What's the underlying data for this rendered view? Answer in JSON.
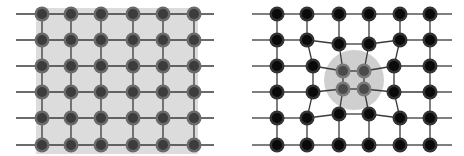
{
  "colors": {
    "background": "#ffffff",
    "left_region_fill": "#dcdcdc",
    "right_region_fill": "#cfcfcf",
    "line": "#3a3a3a",
    "node_left_outer": "#6a6a6a",
    "node_left_inner": "#3c3c3c",
    "node_right_outer": "#333333",
    "node_right_inner": "#0a0a0a",
    "node_focus_outer": "#7a7a7a",
    "node_focus_inner": "#4a4a4a"
  },
  "left_panel": {
    "label": "regular-grid",
    "region": {
      "x": 36,
      "y": 8,
      "w": 162,
      "h": 146
    },
    "line_extent": {
      "x1": 16,
      "x2": 214
    },
    "columns": [
      42,
      71,
      101,
      133,
      163,
      194
    ],
    "rows": [
      14,
      40,
      66,
      92,
      118,
      145
    ]
  },
  "right_panel": {
    "label": "warped-grid",
    "focus_circle": {
      "cx": 354,
      "cy": 80,
      "r": 30
    },
    "line_extent": {
      "x1": 252,
      "x2": 452
    },
    "nodes": [
      [
        [
          277,
          14
        ],
        [
          307,
          14
        ],
        [
          339,
          14
        ],
        [
          369,
          14
        ],
        [
          400,
          14
        ],
        [
          430,
          14
        ]
      ],
      [
        [
          277,
          40
        ],
        [
          307,
          40
        ],
        [
          339,
          44
        ],
        [
          369,
          44
        ],
        [
          400,
          40
        ],
        [
          430,
          40
        ]
      ],
      [
        [
          277,
          66
        ],
        [
          313,
          66
        ],
        [
          343,
          71
        ],
        [
          364,
          71
        ],
        [
          394,
          66
        ],
        [
          430,
          66
        ]
      ],
      [
        [
          277,
          92
        ],
        [
          313,
          92
        ],
        [
          343,
          89
        ],
        [
          364,
          89
        ],
        [
          394,
          92
        ],
        [
          430,
          92
        ]
      ],
      [
        [
          277,
          118
        ],
        [
          307,
          118
        ],
        [
          339,
          114
        ],
        [
          369,
          114
        ],
        [
          400,
          118
        ],
        [
          430,
          118
        ]
      ],
      [
        [
          277,
          145
        ],
        [
          307,
          145
        ],
        [
          339,
          145
        ],
        [
          369,
          145
        ],
        [
          400,
          145
        ],
        [
          430,
          145
        ]
      ]
    ],
    "focus_nodes": [
      [
        2,
        2
      ],
      [
        2,
        3
      ],
      [
        3,
        2
      ],
      [
        3,
        3
      ]
    ]
  }
}
